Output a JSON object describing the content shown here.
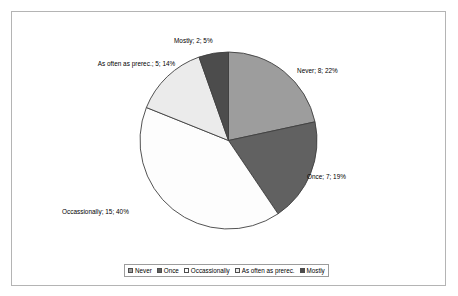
{
  "chart_data": {
    "type": "pie",
    "title": "",
    "categories": [
      "Never",
      "Once",
      "Occassionally",
      "As often as prerec.",
      "Mostly"
    ],
    "values": [
      8,
      7,
      15,
      5,
      2
    ],
    "percents": [
      22,
      19,
      40,
      14,
      5
    ],
    "total": 37,
    "start_angle_deg": 0,
    "direction": "clockwise",
    "legend_position": "bottom",
    "grid": false,
    "colors": [
      "#9d9d9d",
      "#616161",
      "#fdfdfd",
      "#ebebeb",
      "#4c4c4c"
    ],
    "slice_border_color": "#404040",
    "data_labels": [
      {
        "key": "never",
        "text": "Never; 8; 22%"
      },
      {
        "key": "once",
        "text": "Once; 7; 19%"
      },
      {
        "key": "occassionally",
        "text": "Occassionally; 15; 40%"
      },
      {
        "key": "asoften",
        "text": "As often as prerec.; 5; 14%"
      },
      {
        "key": "mostly",
        "text": "Mostly; 2; 5%"
      }
    ]
  },
  "legend": {
    "items": [
      {
        "label": "Never",
        "color": "#9d9d9d"
      },
      {
        "label": "Once",
        "color": "#616161"
      },
      {
        "label": "Occassionally",
        "color": "#fdfdfd"
      },
      {
        "label": "As often as prerec.",
        "color": "#ebebeb"
      },
      {
        "label": "Mostly",
        "color": "#4c4c4c"
      }
    ]
  },
  "frame": {
    "border_color": "#b4b4b4",
    "background": "#ffffff"
  }
}
